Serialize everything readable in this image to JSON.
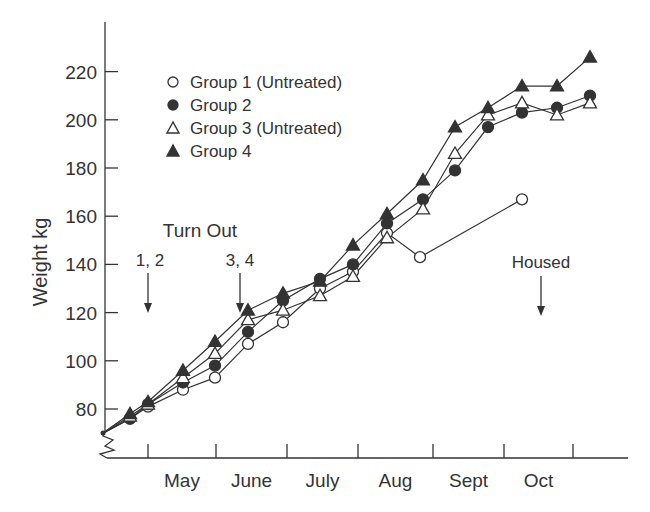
{
  "chart_data": {
    "type": "line",
    "title": "",
    "xlabel": "",
    "ylabel": "Weight kg",
    "ylim": [
      65,
      235
    ],
    "yticks": [
      80,
      100,
      120,
      140,
      160,
      180,
      200,
      220
    ],
    "y_axis_break": true,
    "grid": false,
    "legend_position": "upper-left",
    "x_month_labels": [
      "May",
      "June",
      "July",
      "Aug",
      "Sept",
      "Oct"
    ],
    "x_tick_px": [
      148,
      216,
      287,
      358,
      433,
      504,
      573
    ],
    "x_sample_px": [
      103,
      130,
      148,
      183,
      215,
      248,
      283,
      320,
      353,
      387,
      422,
      455,
      488,
      522,
      557,
      590
    ],
    "series": [
      {
        "name": "Group 1 (Untreated)",
        "marker": "open-circle",
        "points": [
          [
            103,
            70
          ],
          [
            130,
            76
          ],
          [
            148,
            81
          ],
          [
            183,
            88
          ],
          [
            215,
            93
          ],
          [
            248,
            107
          ],
          [
            283,
            116
          ],
          [
            320,
            130
          ],
          [
            353,
            137
          ],
          [
            387,
            153
          ],
          [
            420,
            143
          ],
          [
            522,
            167
          ]
        ]
      },
      {
        "name": "Group 2",
        "marker": "filled-circle",
        "points": [
          [
            103,
            70
          ],
          [
            130,
            76
          ],
          [
            148,
            82
          ],
          [
            183,
            91
          ],
          [
            215,
            98
          ],
          [
            248,
            112
          ],
          [
            283,
            125
          ],
          [
            320,
            134
          ],
          [
            353,
            140
          ],
          [
            387,
            157
          ],
          [
            423,
            167
          ],
          [
            455,
            179
          ],
          [
            488,
            197
          ],
          [
            522,
            203
          ],
          [
            557,
            205
          ],
          [
            590,
            210
          ]
        ]
      },
      {
        "name": "Group 3 (Untreated)",
        "marker": "open-triangle",
        "points": [
          [
            103,
            70
          ],
          [
            130,
            77
          ],
          [
            148,
            82
          ],
          [
            183,
            93
          ],
          [
            215,
            103
          ],
          [
            248,
            117
          ],
          [
            283,
            121
          ],
          [
            320,
            127
          ],
          [
            353,
            135
          ],
          [
            387,
            151
          ],
          [
            423,
            163
          ],
          [
            455,
            186
          ],
          [
            488,
            202
          ],
          [
            522,
            207
          ],
          [
            557,
            202
          ],
          [
            590,
            207
          ]
        ]
      },
      {
        "name": "Group 4",
        "marker": "filled-triangle",
        "points": [
          [
            103,
            70
          ],
          [
            130,
            78
          ],
          [
            148,
            83
          ],
          [
            183,
            96
          ],
          [
            215,
            108
          ],
          [
            248,
            121
          ],
          [
            283,
            128
          ],
          [
            320,
            133
          ],
          [
            353,
            148
          ],
          [
            387,
            161
          ],
          [
            423,
            175
          ],
          [
            455,
            197
          ],
          [
            488,
            205
          ],
          [
            522,
            214
          ],
          [
            557,
            214
          ],
          [
            590,
            226
          ]
        ]
      }
    ],
    "annotations": [
      {
        "text": "Turn Out",
        "x": 200,
        "y": 237
      },
      {
        "text": "1, 2",
        "x": 150,
        "y": 266,
        "arrow_x": 148,
        "arrow_from": 273,
        "arrow_to": 313
      },
      {
        "text": "3, 4",
        "x": 240,
        "y": 266,
        "arrow_x": 240,
        "arrow_from": 273,
        "arrow_to": 313
      },
      {
        "text": "Housed",
        "x": 541,
        "y": 268,
        "arrow_x": 541,
        "arrow_from": 276,
        "arrow_to": 316
      }
    ]
  },
  "legend": {
    "items": [
      {
        "label": "Group 1 (Untreated)",
        "marker": "open-circle"
      },
      {
        "label": "Group 2",
        "marker": "filled-circle"
      },
      {
        "label": "Group 3 (Untreated)",
        "marker": "open-triangle"
      },
      {
        "label": "Group 4",
        "marker": "filled-triangle"
      }
    ]
  },
  "colors": {
    "ink": "#333333",
    "background": "#ffffff"
  }
}
